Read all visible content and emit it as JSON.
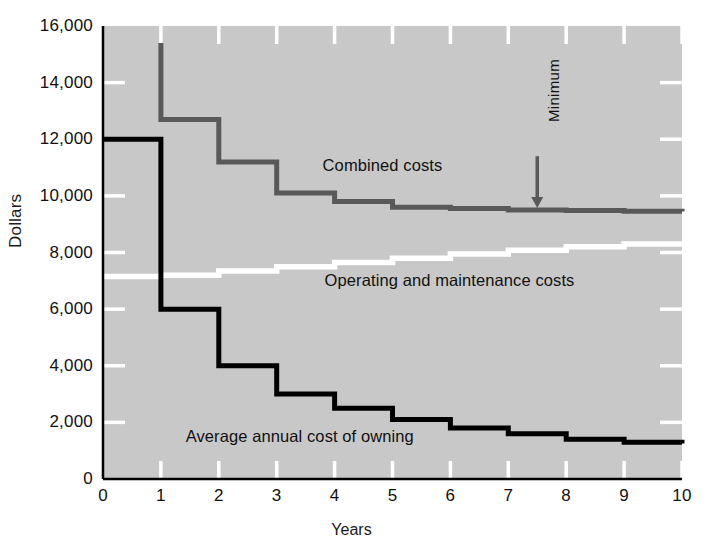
{
  "chart_data": {
    "type": "line",
    "title": "",
    "xlabel": "Years",
    "ylabel": "Dollars",
    "xlim": [
      0,
      10
    ],
    "ylim": [
      0,
      16000
    ],
    "grid": true,
    "legend_position": "inline-annotations",
    "plot_background": "#c8c8c8",
    "x_ticks": [
      "0",
      "1",
      "2",
      "3",
      "4",
      "5",
      "6",
      "7",
      "8",
      "9",
      "10"
    ],
    "x_tick_values": [
      0,
      1,
      2,
      3,
      4,
      5,
      6,
      7,
      8,
      9,
      10
    ],
    "y_ticks": [
      "0",
      "2,000",
      "4,000",
      "6,000",
      "8,000",
      "10,000",
      "12,000",
      "14,000",
      "16,000"
    ],
    "y_tick_values": [
      0,
      2000,
      4000,
      6000,
      8000,
      10000,
      12000,
      14000,
      16000
    ],
    "categories": [
      0,
      1,
      2,
      3,
      4,
      5,
      6,
      7,
      8,
      9,
      10
    ],
    "series": [
      {
        "name": "Combined costs",
        "color": "#595959",
        "step": "post",
        "label_x": 4.0,
        "label_y": 11050,
        "values": [
          15400,
          12700,
          11200,
          10100,
          9800,
          9600,
          9550,
          9500,
          9480,
          9460,
          9450
        ],
        "note": "first segment is the year-0 to year-1 spike at 15,400 then steps down"
      },
      {
        "name": "Operating and maintenance costs",
        "color": "#ffffff",
        "step": "post",
        "label_x": 4.0,
        "label_y": 7050,
        "values": [
          7150,
          7200,
          7350,
          7500,
          7650,
          7800,
          7950,
          8080,
          8200,
          8300,
          8350
        ]
      },
      {
        "name": "Average annual cost of owning",
        "color": "#000000",
        "step": "post",
        "label_x": 1.6,
        "label_y": 1500,
        "values": [
          12000,
          6000,
          4000,
          3000,
          2500,
          2100,
          1800,
          1600,
          1400,
          1300,
          1250
        ]
      }
    ],
    "annotations": [
      {
        "name": "minimum-marker",
        "text": "Minimum",
        "x": 7.5,
        "y": 9500,
        "arrow": "down",
        "text_orientation": "vertical",
        "arrow_top_y": 11400,
        "arrow_color": "#595959"
      }
    ]
  },
  "axis": {
    "y_title": "Dollars",
    "x_title": "Years"
  },
  "labels": {
    "combined": "Combined costs",
    "operating": "Operating and maintenance costs",
    "owning": "Average annual cost of owning",
    "minimum": "Minimum"
  }
}
